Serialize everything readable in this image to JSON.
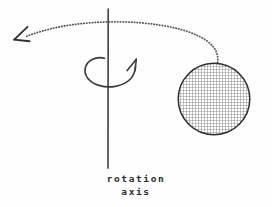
{
  "figure": {
    "caption_line_1": "rotation",
    "caption_line_2": "axis",
    "colors": {
      "background": "#fefefe",
      "ink": "#3a3a3a",
      "axis": "#4a4a4a",
      "hatch": "#9a9a9a",
      "outline": "#2e2e2e"
    }
  },
  "elements": {
    "rotation_axis_label": "rotation axis",
    "vertical_axis": {
      "name": "rotation-axis-line",
      "x": 108,
      "y_top": 9,
      "y_bottom": 168
    },
    "spin_arrow": {
      "name": "spin-direction-arrow",
      "direction": "counterclockwise-viewed-from-top",
      "arrowhead_x": 136,
      "arrowhead_y": 59
    },
    "orbit_path": {
      "name": "orbit-trajectory-dotted-curve",
      "style": "dotted",
      "start_x": 217,
      "start_y": 62,
      "end_x": 27,
      "end_y": 36
    },
    "orbit_arrowhead": {
      "name": "orbit-direction-arrowhead",
      "x": 15,
      "y": 32,
      "points": "down-left"
    },
    "sphere": {
      "name": "rotating-body-sphere",
      "center_x": 214,
      "center_y": 99,
      "radius": 36,
      "fill": "cross-hatch-grid"
    }
  }
}
